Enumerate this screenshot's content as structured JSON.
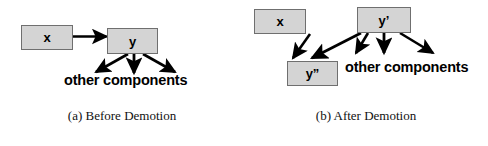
{
  "figure": {
    "type": "diagram",
    "background_color": "#ffffff",
    "node_fill_color": "#d4d4d4",
    "node_border_color": "#6f6f6f",
    "arrow_color": "#000000",
    "panels": [
      {
        "id": "a",
        "caption": "(a) Before Demotion",
        "nodes": [
          {
            "id": "x",
            "label": "x"
          },
          {
            "id": "y",
            "label": "y"
          }
        ],
        "text_labels": [
          {
            "id": "other-components",
            "label": "other components"
          }
        ],
        "edges": [
          {
            "from": "x",
            "to": "y"
          },
          {
            "from": "y",
            "to": "other components"
          },
          {
            "from": "y",
            "to": "other components"
          },
          {
            "from": "y",
            "to": "other components"
          }
        ]
      },
      {
        "id": "b",
        "caption": "(b) After Demotion",
        "nodes": [
          {
            "id": "x",
            "label": "x"
          },
          {
            "id": "yp",
            "label": "y’"
          },
          {
            "id": "ypp",
            "label": "y”"
          }
        ],
        "text_labels": [
          {
            "id": "other-components",
            "label": "other components"
          }
        ],
        "edges": [
          {
            "from": "x",
            "to": "y”"
          },
          {
            "from": "y’",
            "to": "y”"
          },
          {
            "from": "y’",
            "to": "other components"
          },
          {
            "from": "y’",
            "to": "other components"
          },
          {
            "from": "y’",
            "to": "other components"
          }
        ]
      }
    ]
  }
}
